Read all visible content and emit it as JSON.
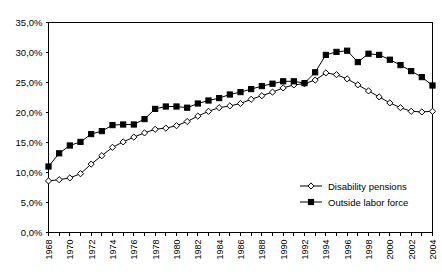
{
  "chart_data": {
    "type": "line",
    "title": "",
    "xlabel": "",
    "ylabel": "",
    "ylim": [
      0,
      35
    ],
    "ytick_values": [
      0,
      5,
      10,
      15,
      20,
      25,
      30,
      35
    ],
    "ytick_labels": [
      "0,0%",
      "5,0%",
      "10,0%",
      "15,0%",
      "20,0%",
      "25,0%",
      "30,0%",
      "35,0%"
    ],
    "xlim": [
      1968,
      2004
    ],
    "x": [
      1968,
      1969,
      1970,
      1971,
      1972,
      1973,
      1974,
      1975,
      1976,
      1977,
      1978,
      1979,
      1980,
      1981,
      1982,
      1983,
      1984,
      1985,
      1986,
      1987,
      1988,
      1989,
      1990,
      1991,
      1992,
      1993,
      1994,
      1995,
      1996,
      1997,
      1998,
      1999,
      2000,
      2001,
      2002,
      2003,
      2004
    ],
    "xtick_labels": [
      "1968",
      "1970",
      "1972",
      "1974",
      "1976",
      "1978",
      "1980",
      "1982",
      "1984",
      "1986",
      "1988",
      "1990",
      "1992",
      "1994",
      "1996",
      "1998",
      "2000",
      "2002",
      "2004"
    ],
    "xtick_label_interval": 2,
    "grid": false,
    "legend_position": "inside-lower-right",
    "series": [
      {
        "name": "Disability pensions",
        "marker": "open-diamond",
        "values": [
          8.6,
          8.8,
          9.1,
          9.8,
          11.4,
          12.8,
          14.2,
          15.1,
          15.9,
          16.6,
          17.2,
          17.4,
          17.8,
          18.5,
          19.4,
          20.2,
          20.8,
          21.1,
          21.5,
          22.2,
          22.8,
          23.4,
          24.1,
          24.6,
          24.8,
          25.4,
          26.6,
          26.3,
          25.6,
          24.6,
          23.6,
          22.6,
          21.6,
          20.8,
          20.2,
          20.1,
          20.2
        ]
      },
      {
        "name": "Outside labor force",
        "marker": "filled-square",
        "values": [
          11.0,
          13.2,
          14.5,
          15.1,
          16.4,
          16.9,
          17.9,
          18.0,
          18.0,
          18.9,
          20.6,
          21.0,
          21.0,
          20.8,
          21.5,
          22.0,
          22.4,
          23.0,
          23.4,
          23.9,
          24.4,
          24.8,
          25.2,
          25.2,
          24.9,
          26.7,
          29.6,
          30.1,
          30.3,
          28.4,
          29.8,
          29.6,
          28.8,
          27.9,
          26.9,
          25.9,
          24.5
        ]
      }
    ]
  },
  "legend": {
    "items": [
      {
        "label": "Disability pensions",
        "marker": "open-diamond"
      },
      {
        "label": "Outside labor force",
        "marker": "filled-square"
      }
    ]
  }
}
